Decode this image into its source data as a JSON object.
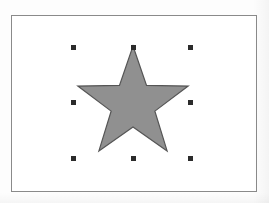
{
  "canvas": {
    "width": 269,
    "height": 203,
    "background_color": "#fdfdfd",
    "label": "drawing canvas"
  },
  "document_frame": {
    "label": "page border",
    "x": 11,
    "y": 15,
    "width": 246,
    "height": 177,
    "border_color": "#8a8a8a",
    "border_width": 1,
    "fill_color": "#ffffff"
  },
  "shape": {
    "name": "star",
    "type": "polygon-star",
    "points": 5,
    "fill_color": "#909090",
    "stroke_color": "#555555",
    "stroke_width": 1.2,
    "center_x": 133,
    "center_y": 104,
    "outer_radius": 58,
    "inner_radius": 23,
    "selected": true
  },
  "selection": {
    "label": "selection handles",
    "handle_color": "#2b2b2b",
    "handle_size": 5,
    "box": {
      "left": 73,
      "top": 47,
      "right": 190,
      "bottom": 158
    },
    "handles": [
      {
        "name": "handle-top-left",
        "x": 73,
        "y": 47,
        "cursor": "nwse-resize"
      },
      {
        "name": "handle-top-center",
        "x": 133,
        "y": 47,
        "cursor": "ns-resize"
      },
      {
        "name": "handle-top-right",
        "x": 190,
        "y": 47,
        "cursor": "nesw-resize"
      },
      {
        "name": "handle-middle-left",
        "x": 73,
        "y": 102,
        "cursor": "ew-resize"
      },
      {
        "name": "handle-middle-right",
        "x": 190,
        "y": 102,
        "cursor": "ew-resize"
      },
      {
        "name": "handle-bottom-left",
        "x": 73,
        "y": 158,
        "cursor": "nesw-resize"
      },
      {
        "name": "handle-bottom-center",
        "x": 133,
        "y": 158,
        "cursor": "ns-resize"
      },
      {
        "name": "handle-bottom-right",
        "x": 190,
        "y": 158,
        "cursor": "nwse-resize"
      }
    ]
  }
}
